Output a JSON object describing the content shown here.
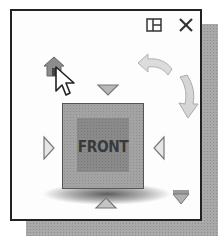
{
  "widget": {
    "name": "ViewCube",
    "cube": {
      "face_label": "FRONT"
    },
    "controls": {
      "layout_icon": "window-layout-icon",
      "close_icon": "close-icon",
      "home_icon": "home-icon",
      "rotate_ccw_icon": "rotate-counterclockwise-arrow-icon",
      "rotate_cw_icon": "rotate-clockwise-arrow-icon",
      "arrows": [
        "top",
        "left",
        "right",
        "bottom",
        "bottom-right-corner"
      ]
    },
    "colors": {
      "border": "#222222",
      "background": "#fdfdfd",
      "cube_outer": "#a3a3a3",
      "cube_inner": "#8a8a8a",
      "label": "#3a3a3a",
      "shadow": "#a9a9a9",
      "arrow_fill": "#b8b8b8"
    }
  }
}
